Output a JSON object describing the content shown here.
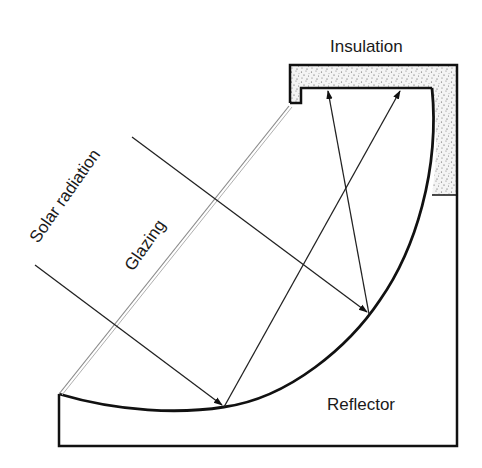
{
  "diagram": {
    "type": "solar-collector-cross-section",
    "labels": {
      "insulation": "Insulation",
      "solar_radiation": "Solar radiation",
      "glazing": "Glazing",
      "reflector": "Reflector"
    },
    "colors": {
      "stroke": "#111111",
      "glazing": "#9a9a9a",
      "insulation_fill": "#f2f2f2",
      "insulation_dots": "#555555",
      "background": "#ffffff"
    }
  }
}
